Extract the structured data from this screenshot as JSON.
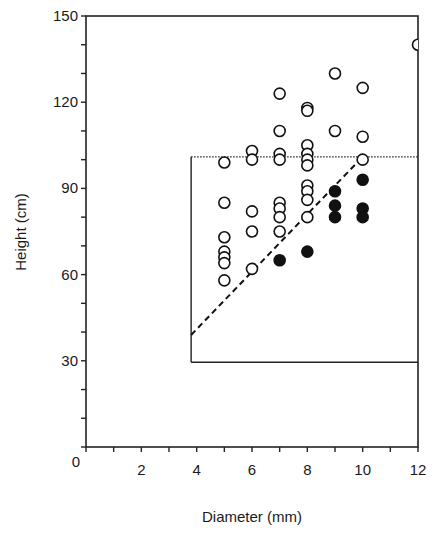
{
  "chart_data": {
    "type": "scatter",
    "title": "",
    "xlabel": "Diameter (mm)",
    "ylabel": "Height (cm)",
    "xlim": [
      0,
      12
    ],
    "ylim": [
      0,
      150
    ],
    "x_ticks": [
      0,
      1,
      2,
      3,
      4,
      5,
      6,
      7,
      8,
      9,
      10,
      11,
      12
    ],
    "x_tick_labels": [
      "",
      "",
      "2",
      "",
      "4",
      "",
      "6",
      "",
      "8",
      "",
      "10",
      "",
      "12"
    ],
    "y_ticks": [
      0,
      10,
      20,
      30,
      40,
      50,
      60,
      70,
      80,
      90,
      100,
      110,
      120,
      130,
      140,
      150
    ],
    "y_tick_labels": [
      "0",
      "",
      "",
      "30",
      "",
      "",
      "60",
      "",
      "",
      "90",
      "",
      "",
      "120",
      "",
      "",
      "150"
    ],
    "grid": false,
    "legend": null,
    "series": [
      {
        "name": "open circles",
        "marker": "open-circle",
        "points": [
          [
            5,
            99
          ],
          [
            5,
            85
          ],
          [
            5,
            73
          ],
          [
            5,
            68
          ],
          [
            5,
            66
          ],
          [
            5,
            64
          ],
          [
            5,
            58
          ],
          [
            6,
            103
          ],
          [
            6,
            100
          ],
          [
            6,
            82
          ],
          [
            6,
            75
          ],
          [
            6,
            62
          ],
          [
            7,
            123
          ],
          [
            7,
            110
          ],
          [
            7,
            102
          ],
          [
            7,
            100
          ],
          [
            7,
            85
          ],
          [
            7,
            83
          ],
          [
            7,
            80
          ],
          [
            7,
            75
          ],
          [
            8,
            118
          ],
          [
            8,
            117
          ],
          [
            8,
            105
          ],
          [
            8,
            102
          ],
          [
            8,
            100
          ],
          [
            8,
            98
          ],
          [
            8,
            91
          ],
          [
            8,
            89
          ],
          [
            8,
            86
          ],
          [
            8,
            80
          ],
          [
            9,
            130
          ],
          [
            9,
            110
          ],
          [
            10,
            125
          ],
          [
            10,
            108
          ],
          [
            10,
            100
          ],
          [
            12,
            140
          ]
        ]
      },
      {
        "name": "filled circles",
        "marker": "filled-circle",
        "points": [
          [
            7,
            65
          ],
          [
            8,
            68
          ],
          [
            9,
            89
          ],
          [
            9,
            84
          ],
          [
            9,
            80
          ],
          [
            10,
            93
          ],
          [
            10,
            83
          ],
          [
            10,
            80
          ]
        ]
      }
    ],
    "annotations": [
      {
        "type": "box",
        "style": "solid",
        "x": [
          3.8,
          12
        ],
        "y": [
          29.5,
          101
        ],
        "top_edge_style": "dotted"
      },
      {
        "type": "line",
        "style": "dashed",
        "from": [
          3.8,
          39
        ],
        "to": [
          10,
          101
        ]
      }
    ]
  }
}
